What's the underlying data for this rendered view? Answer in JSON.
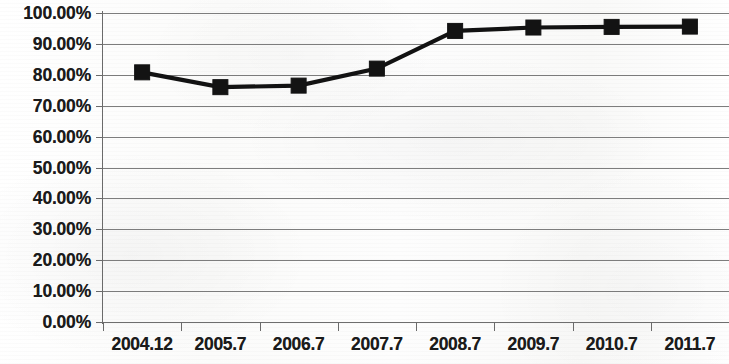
{
  "chart_data": {
    "type": "line",
    "title": "",
    "subtitle": "",
    "xlabel": "",
    "ylabel": "",
    "categories": [
      "2004.12",
      "2005.7",
      "2006.7",
      "2007.7",
      "2008.7",
      "2009.7",
      "2010.7",
      "2011.7"
    ],
    "values": [
      80.8,
      76.0,
      76.5,
      82.0,
      94.2,
      95.3,
      95.5,
      95.6
    ],
    "series": [
      {
        "name": "",
        "values": [
          80.8,
          76.0,
          76.5,
          82.0,
          94.2,
          95.3,
          95.5,
          95.6
        ]
      }
    ],
    "value_labels": [
      "80.80%",
      "76.00%",
      "76.50%",
      "82.00%",
      "94.20%",
      "95.30%",
      "95.50%",
      "95.60%"
    ],
    "ylim": [
      0,
      100
    ],
    "ytick_values": [
      100,
      90,
      80,
      70,
      60,
      50,
      40,
      30,
      20,
      10,
      0
    ],
    "ytick_labels": [
      "100.00%",
      "90.00%",
      "80.00%",
      "70.00%",
      "60.00%",
      "50.00%",
      "40.00%",
      "30.00%",
      "20.00%",
      "10.00%",
      "0.00%"
    ],
    "xtick_labels": [
      "2004.12",
      "2005.7",
      "2006.7",
      "2007.7",
      "2008.7",
      "2009.7",
      "2010.7",
      "2011.7"
    ],
    "grid": "horizontal",
    "legend": "none",
    "marker": "square",
    "marker_color": "#131313",
    "line_color": "#121212",
    "gridline_color": "#7d7d7d",
    "axis_color": "#6b6b6b",
    "background_color": "#fdfdfd",
    "text_color": "#1b1b1b"
  }
}
